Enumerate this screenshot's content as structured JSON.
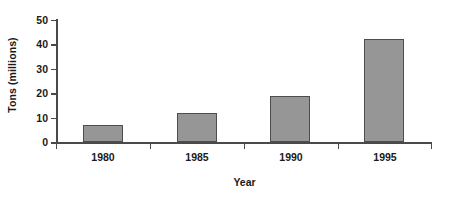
{
  "chart_data": {
    "type": "bar",
    "title": "",
    "subtitle": "",
    "xlabel": "Year",
    "ylabel": "Tons (millions)",
    "categories": [
      "1980",
      "1985",
      "1990",
      "1995"
    ],
    "values": [
      7,
      12,
      19,
      42
    ],
    "series": [
      {
        "name": "Tons (millions)",
        "values": [
          7,
          12,
          19,
          42
        ]
      }
    ],
    "ylim": [
      0,
      50
    ],
    "yticks": [
      0,
      10,
      20,
      30,
      40,
      50
    ],
    "ytick_labels": [
      "0",
      "10",
      "20",
      "30",
      "40",
      "50"
    ],
    "grid": false,
    "legend": false,
    "legend_position": "none",
    "bar_color": "#969696",
    "bar_border_color": "#4d4d4d",
    "axis_color": "#4a4a4a",
    "text_color": "#1a1a1a",
    "background_color": "#ffffff"
  }
}
